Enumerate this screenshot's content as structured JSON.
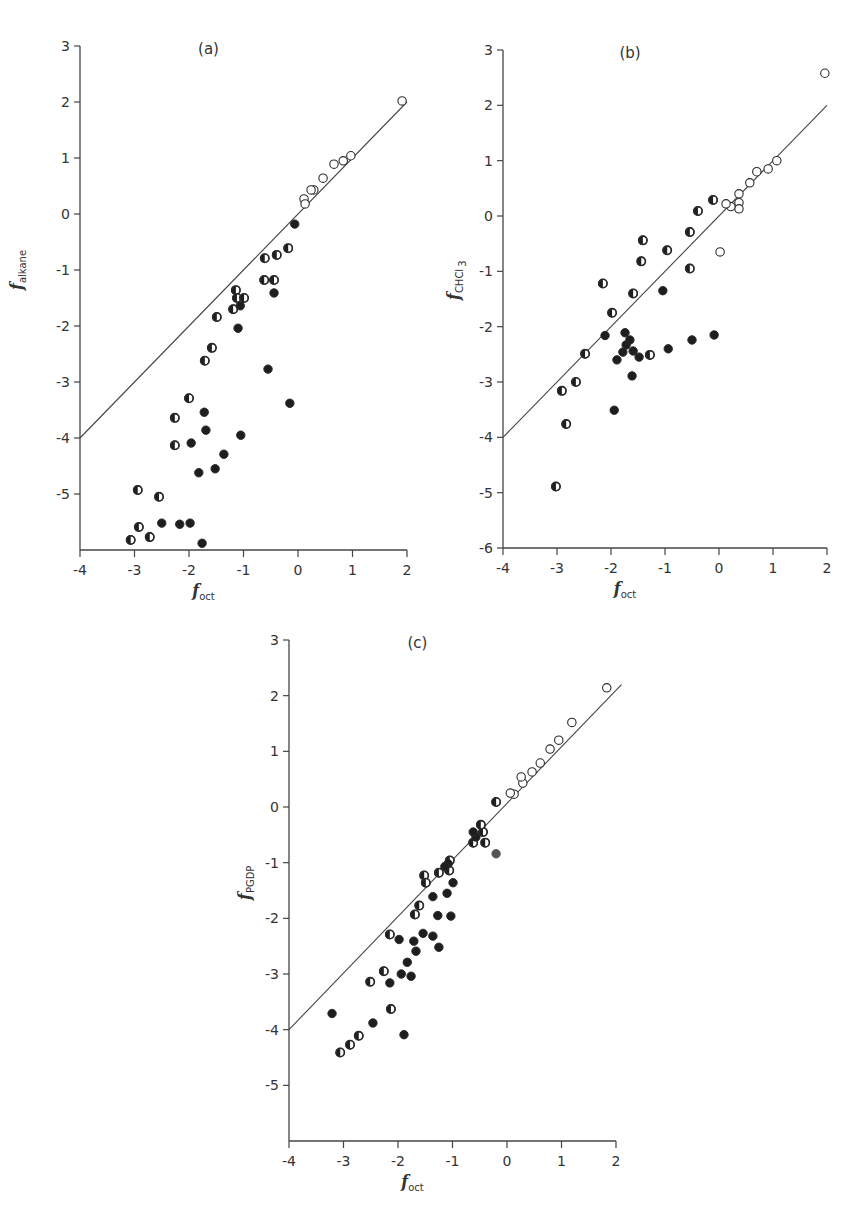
{
  "figure": {
    "line_color": "#444444",
    "marker_fill_dark": "#1e1e1e",
    "marker_fill_gray": "#555555",
    "marker_stroke": "#2a2a2a"
  },
  "chart_data": [
    {
      "id": "a",
      "type": "scatter",
      "title": "(a)",
      "xlabel": "f",
      "xlabel_sub": "oct",
      "ylabel": "f",
      "ylabel_sub": "alkane",
      "xlim": [
        -4,
        2
      ],
      "ylim": [
        -6,
        3
      ],
      "xticks": [
        -4,
        -3,
        -2,
        -1,
        0,
        1,
        2
      ],
      "yticks": [
        3,
        2,
        1,
        0,
        -1,
        -2,
        -3,
        -4,
        -5
      ],
      "grid": false,
      "reference_line": {
        "x": [
          -4,
          2
        ],
        "y": [
          -4,
          2
        ],
        "label": "y = x"
      },
      "series": [
        {
          "name": "open",
          "marker": "open-circle",
          "points": [
            [
              1.91,
              2.02
            ],
            [
              0.97,
              1.04
            ],
            [
              0.83,
              0.95
            ],
            [
              0.66,
              0.89
            ],
            [
              0.46,
              0.64
            ],
            [
              0.29,
              0.43
            ],
            [
              0.24,
              0.43
            ],
            [
              0.11,
              0.27
            ],
            [
              0.13,
              0.18
            ]
          ]
        },
        {
          "name": "half-filled",
          "marker": "half-circle",
          "points": [
            [
              -0.18,
              -0.61
            ],
            [
              -0.39,
              -0.73
            ],
            [
              -0.61,
              -0.79
            ],
            [
              -0.62,
              -1.18
            ],
            [
              -0.44,
              -1.18
            ],
            [
              -1.14,
              -1.36
            ],
            [
              -1.12,
              -1.5
            ],
            [
              -0.99,
              -1.5
            ],
            [
              -1.19,
              -1.7
            ],
            [
              -1.49,
              -1.84
            ],
            [
              -1.58,
              -2.39
            ],
            [
              -1.71,
              -2.62
            ],
            [
              -2.0,
              -3.29
            ],
            [
              -2.26,
              -3.64
            ],
            [
              -2.26,
              -4.13
            ],
            [
              -2.94,
              -4.93
            ],
            [
              -2.55,
              -5.05
            ],
            [
              -2.92,
              -5.59
            ],
            [
              -2.72,
              -5.77
            ],
            [
              -3.07,
              -5.82
            ]
          ]
        },
        {
          "name": "filled",
          "marker": "filled-circle",
          "points": [
            [
              -0.06,
              -0.18
            ],
            [
              -0.44,
              -1.41
            ],
            [
              -1.06,
              -1.64
            ],
            [
              -1.1,
              -2.04
            ],
            [
              -0.55,
              -2.77
            ],
            [
              -0.15,
              -3.38
            ],
            [
              -1.72,
              -3.54
            ],
            [
              -1.69,
              -3.86
            ],
            [
              -1.96,
              -4.09
            ],
            [
              -1.05,
              -3.95
            ],
            [
              -1.36,
              -4.29
            ],
            [
              -1.52,
              -4.55
            ],
            [
              -1.82,
              -4.62
            ],
            [
              -2.5,
              -5.52
            ],
            [
              -2.17,
              -5.54
            ],
            [
              -1.98,
              -5.52
            ],
            [
              -1.76,
              -5.88
            ]
          ]
        }
      ]
    },
    {
      "id": "b",
      "type": "scatter",
      "title": "(b)",
      "xlabel": "f",
      "xlabel_sub": "oct",
      "ylabel": "f",
      "ylabel_sub": "CHCl",
      "ylabel_sub2": "3",
      "xlim": [
        -4,
        2
      ],
      "ylim": [
        -6,
        3
      ],
      "xticks": [
        -4,
        -3,
        -2,
        -1,
        0,
        1,
        2
      ],
      "yticks": [
        3,
        2,
        1,
        0,
        -1,
        -2,
        -3,
        -4,
        -5,
        -6
      ],
      "grid": false,
      "reference_line": {
        "x": [
          -4,
          2
        ],
        "y": [
          -4,
          2
        ],
        "label": "y = x"
      },
      "series": [
        {
          "name": "open",
          "marker": "open-circle",
          "points": [
            [
              1.96,
              2.58
            ],
            [
              1.07,
              1.0
            ],
            [
              0.91,
              0.85
            ],
            [
              0.7,
              0.8
            ],
            [
              0.57,
              0.6
            ],
            [
              0.37,
              0.4
            ],
            [
              0.37,
              0.24
            ],
            [
              0.37,
              0.13
            ],
            [
              0.22,
              0.17
            ],
            [
              0.13,
              0.22
            ],
            [
              0.02,
              -0.65
            ]
          ]
        },
        {
          "name": "half-filled",
          "marker": "half-circle",
          "points": [
            [
              -0.11,
              0.29
            ],
            [
              -0.39,
              0.09
            ],
            [
              -0.54,
              -0.29
            ],
            [
              -0.96,
              -0.62
            ],
            [
              -1.41,
              -0.44
            ],
            [
              -1.44,
              -0.82
            ],
            [
              -0.54,
              -0.95
            ],
            [
              -2.15,
              -1.22
            ],
            [
              -1.59,
              -1.4
            ],
            [
              -1.98,
              -1.75
            ],
            [
              -1.28,
              -2.51
            ],
            [
              -2.48,
              -2.49
            ],
            [
              -2.65,
              -3.0
            ],
            [
              -2.91,
              -3.16
            ],
            [
              -2.83,
              -3.76
            ],
            [
              -3.02,
              -4.89
            ]
          ]
        },
        {
          "name": "filled",
          "marker": "filled-circle",
          "points": [
            [
              -1.04,
              -1.35
            ],
            [
              -2.11,
              -2.16
            ],
            [
              -1.74,
              -2.11
            ],
            [
              -1.65,
              -2.24
            ],
            [
              -1.72,
              -2.33
            ],
            [
              -1.78,
              -2.46
            ],
            [
              -1.59,
              -2.44
            ],
            [
              -1.48,
              -2.55
            ],
            [
              -1.89,
              -2.6
            ],
            [
              -1.61,
              -2.89
            ],
            [
              -0.94,
              -2.4
            ],
            [
              -0.5,
              -2.24
            ],
            [
              -0.09,
              -2.15
            ],
            [
              -1.94,
              -3.51
            ]
          ]
        }
      ]
    },
    {
      "id": "c",
      "type": "scatter",
      "title": "(c)",
      "xlabel": "f",
      "xlabel_sub": "oct",
      "ylabel": "f",
      "ylabel_sub": "PGDP",
      "xlim": [
        -4,
        2
      ],
      "ylim": [
        -6,
        3
      ],
      "xticks": [
        -4,
        -3,
        -2,
        -1,
        0,
        1,
        2
      ],
      "yticks": [
        3,
        2,
        1,
        0,
        -1,
        -2,
        -3,
        -4,
        -5
      ],
      "grid": false,
      "reference_line": {
        "x": [
          -4,
          2.1
        ],
        "y": [
          -4,
          2.2
        ],
        "label": "fit line"
      },
      "series": [
        {
          "name": "open",
          "marker": "open-circle",
          "points": [
            [
              1.83,
              2.14
            ],
            [
              1.19,
              1.52
            ],
            [
              0.95,
              1.2
            ],
            [
              0.79,
              1.04
            ],
            [
              0.61,
              0.79
            ],
            [
              0.46,
              0.63
            ],
            [
              0.29,
              0.43
            ],
            [
              0.26,
              0.54
            ],
            [
              0.13,
              0.23
            ],
            [
              0.06,
              0.25
            ]
          ]
        },
        {
          "name": "half-filled",
          "marker": "half-circle",
          "points": [
            [
              -0.2,
              0.09
            ],
            [
              -0.4,
              -0.64
            ],
            [
              -0.44,
              -0.45
            ],
            [
              -0.48,
              -0.32
            ],
            [
              -0.62,
              -0.64
            ],
            [
              -1.05,
              -0.96
            ],
            [
              -1.06,
              -1.14
            ],
            [
              -1.25,
              -1.18
            ],
            [
              -1.52,
              -1.23
            ],
            [
              -1.49,
              -1.36
            ],
            [
              -1.61,
              -1.77
            ],
            [
              -1.69,
              -1.93
            ],
            [
              -2.15,
              -2.29
            ],
            [
              -2.26,
              -2.95
            ],
            [
              -2.51,
              -3.14
            ],
            [
              -2.13,
              -3.63
            ],
            [
              -2.72,
              -4.11
            ],
            [
              -2.88,
              -4.27
            ],
            [
              -3.06,
              -4.41
            ]
          ]
        },
        {
          "name": "filled",
          "marker": "filled-circle",
          "points": [
            [
              -0.57,
              -0.54
            ],
            [
              -0.62,
              -0.45
            ],
            [
              -1.08,
              -1.02
            ],
            [
              -1.14,
              -1.07
            ],
            [
              -0.99,
              -1.36
            ],
            [
              -1.1,
              -1.55
            ],
            [
              -1.36,
              -1.61
            ],
            [
              -1.27,
              -1.95
            ],
            [
              -1.03,
              -1.96
            ],
            [
              -1.98,
              -2.38
            ],
            [
              -1.71,
              -2.41
            ],
            [
              -1.54,
              -2.27
            ],
            [
              -1.36,
              -2.32
            ],
            [
              -1.25,
              -2.52
            ],
            [
              -1.67,
              -2.59
            ],
            [
              -1.83,
              -2.79
            ],
            [
              -1.94,
              -3.0
            ],
            [
              -1.76,
              -3.04
            ],
            [
              -2.15,
              -3.16
            ],
            [
              -3.21,
              -3.71
            ],
            [
              -2.46,
              -3.88
            ],
            [
              -1.89,
              -4.09
            ]
          ]
        },
        {
          "name": "gray",
          "marker": "gray-circle",
          "points": [
            [
              -0.2,
              -0.84
            ]
          ]
        }
      ]
    }
  ]
}
